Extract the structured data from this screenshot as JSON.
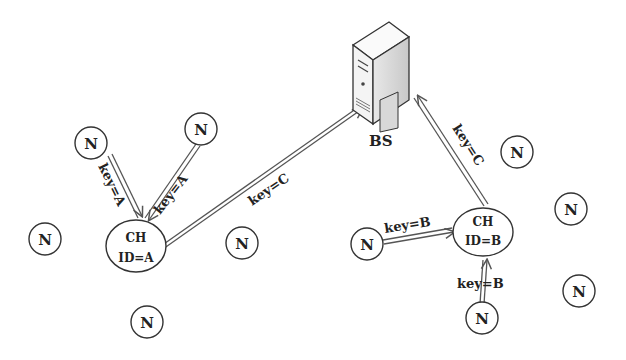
{
  "diagram": {
    "type": "wireless-sensor-network-clustering",
    "base_station": {
      "label": "BS",
      "icon": "server-icon"
    },
    "cluster_heads": [
      {
        "id": "A",
        "title": "CH",
        "id_label": "ID=A"
      },
      {
        "id": "B",
        "title": "CH",
        "id_label": "ID=B"
      }
    ],
    "node_label": "N",
    "edges": [
      {
        "from": "N (top-left)",
        "to": "CH A",
        "label": "key=A"
      },
      {
        "from": "N (top)",
        "to": "CH A",
        "label": "key=A"
      },
      {
        "from": "CH A",
        "to": "BS",
        "label": "key=C"
      },
      {
        "from": "CH B",
        "to": "BS",
        "label": "key=C"
      },
      {
        "from": "N (left of CH B)",
        "to": "CH B",
        "label": "key=B"
      },
      {
        "from": "N (below CH B)",
        "to": "CH B",
        "label": "key=B"
      }
    ],
    "node_count": 11,
    "colors": {
      "stroke": "#333333",
      "text": "#222222",
      "background": "#ffffff"
    }
  }
}
